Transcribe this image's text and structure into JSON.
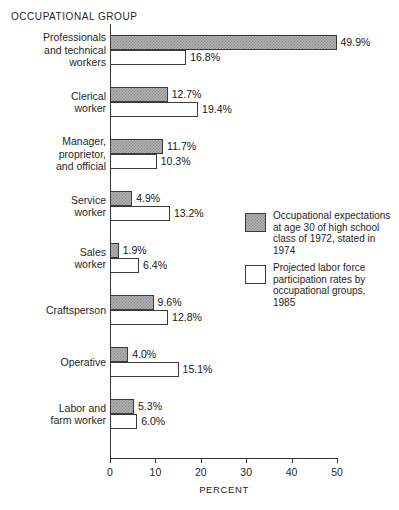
{
  "chart_data": {
    "type": "bar",
    "orientation": "horizontal",
    "title": "OCCUPATIONAL GROUP",
    "xlabel": "PERCENT",
    "ylabel": "OCCUPATIONAL GROUP",
    "xlim": [
      0,
      50
    ],
    "xticks": [
      0,
      10,
      20,
      30,
      40,
      50
    ],
    "xtick_labels": [
      "0",
      "10",
      "20",
      "30",
      "40",
      "50"
    ],
    "grid": false,
    "legend_position": "middle-right",
    "categories": [
      "Professionals and technical workers",
      "Clerical worker",
      "Manager, proprietor, and official",
      "Service worker",
      "Sales worker",
      "Craftsperson",
      "Operative",
      "Labor and farm worker"
    ],
    "category_lines": [
      [
        "Professionals",
        "and technical",
        "workers"
      ],
      [
        "Clerical",
        "worker"
      ],
      [
        "Manager,",
        "proprietor,",
        "and official"
      ],
      [
        "Service",
        "worker"
      ],
      [
        "Sales",
        "worker"
      ],
      [
        "Craftsperson"
      ],
      [
        "Operative"
      ],
      [
        "Labor and",
        "farm worker"
      ]
    ],
    "series": [
      {
        "name": "Occupational expectations at age 30 of high school class of 1972, stated in 1974",
        "key": "expectations",
        "fill": "dark-checker",
        "color": "#b4b4b4",
        "values": [
          49.9,
          12.7,
          11.7,
          4.9,
          1.9,
          9.6,
          4.0,
          5.3
        ],
        "value_labels": [
          "49.9%",
          "12.7%",
          "11.7%",
          "4.9%",
          "1.9%",
          "9.6%",
          "4.0%",
          "5.3%"
        ]
      },
      {
        "name": "Projected labor force participation rates by occupational groups, 1985",
        "key": "projected",
        "fill": "light-stipple",
        "color": "#ffffff",
        "values": [
          16.8,
          19.4,
          10.3,
          13.2,
          6.4,
          12.8,
          15.1,
          6.0
        ],
        "value_labels": [
          "16.8%",
          "19.4%",
          "10.3%",
          "13.2%",
          "6.4%",
          "12.8%",
          "15.1%",
          "6.0%"
        ]
      }
    ]
  },
  "legend": {
    "entries": [
      {
        "swatch": "dark-checker",
        "lines": [
          "Occupational expectations",
          "at age 30 of high school",
          "class of 1972, stated in",
          "1974"
        ]
      },
      {
        "swatch": "light-stipple",
        "lines": [
          "Projected labor force",
          "participation rates by",
          "occupational groups,",
          "1985"
        ]
      }
    ]
  },
  "colors": {
    "axis": "#333333",
    "text": "#1f1f1f",
    "series_a_fill": "#b4b4b4",
    "series_b_fill": "#ffffff",
    "bar_border": "#3a3a3a"
  }
}
